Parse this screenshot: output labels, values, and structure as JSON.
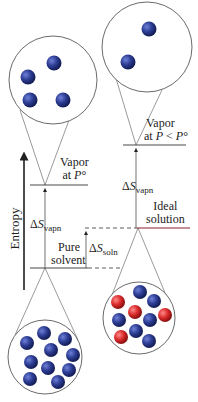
{
  "axis": {
    "label": "Entropy"
  },
  "levels": {
    "vapor_p0": {
      "line1": "Vapor",
      "line2_prefix": "at ",
      "line2_var": "P",
      "line2_suffix": "°"
    },
    "vapor_low": {
      "line1": "Vapor",
      "line2_prefix": "at ",
      "line2_var": "P",
      "line2_mid": " < ",
      "line2_var2": "P",
      "line2_suffix": "°"
    },
    "ideal_solution": {
      "line1": "Ideal",
      "line2": "solution"
    },
    "pure_solvent": {
      "line1": "Pure",
      "line2": "solvent"
    }
  },
  "deltas": {
    "vapn_left": {
      "delta": "Δ",
      "var": "S",
      "sub": "vapn"
    },
    "vapn_right": {
      "delta": "Δ",
      "var": "S",
      "sub": "vapn"
    },
    "soln": {
      "delta": "Δ",
      "var": "S",
      "sub": "soln"
    }
  },
  "colors": {
    "solvent_particle": "#2a3a8c",
    "solute_particle": "#d42a2a",
    "line": "#333333",
    "ideal_line": "#8b1e2b"
  }
}
